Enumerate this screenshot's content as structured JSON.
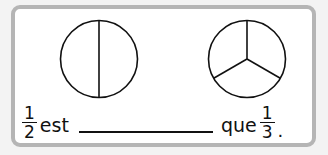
{
  "exercise": {
    "figures": [
      {
        "name": "half-circle",
        "parts": 2,
        "description": "circle divided into 2 equal parts"
      },
      {
        "name": "third-circle",
        "parts": 3,
        "description": "circle divided into 3 equal parts"
      }
    ],
    "sentence": {
      "left_fraction": {
        "numerator": "1",
        "denominator": "2"
      },
      "word_est": "est",
      "blank": "",
      "word_que": "que",
      "right_fraction": {
        "numerator": "1",
        "denominator": "3"
      },
      "end_punctuation": "."
    }
  },
  "colors": {
    "border": "#b5b5b5",
    "background": "#ffffff",
    "outer_background": "#f3f3f3",
    "ink": "#111111"
  }
}
